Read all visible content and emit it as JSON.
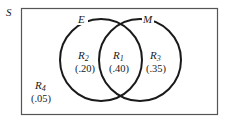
{
  "diagram": {
    "type": "venn",
    "universe_label": "S",
    "sets": [
      {
        "label": "E"
      },
      {
        "label": "M"
      }
    ],
    "regions": [
      {
        "id": "R1",
        "name": "R",
        "sub": "1",
        "value": "(.40)",
        "description": "E and M"
      },
      {
        "id": "R2",
        "name": "R",
        "sub": "2",
        "value": "(.20)",
        "description": "E only"
      },
      {
        "id": "R3",
        "name": "R",
        "sub": "3",
        "value": "(.35)",
        "description": "M only"
      },
      {
        "id": "R4",
        "name": "R",
        "sub": "4",
        "value": "(.05)",
        "description": "neither"
      }
    ],
    "colors": {
      "stroke": "#1a1a1a",
      "frame": "#555555",
      "background": "#ffffff"
    }
  }
}
